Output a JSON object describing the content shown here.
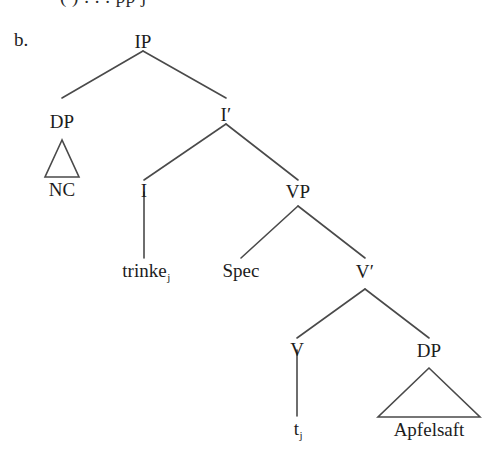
{
  "figure": {
    "item_label": "b.",
    "cropped_top_line": "(  )   . . .  pp   j",
    "language_example": "trinke Apfelsaft",
    "line_color": "#4a4a4a",
    "text_color": "#1c1c1c",
    "background_color": "#ffffff"
  },
  "nodes": {
    "ip": "IP",
    "dp_subject": "DP",
    "nc": "NC",
    "i_bar": "I′",
    "i": "I",
    "trinke": "trinke",
    "trinke_sub": "j",
    "vp": "VP",
    "spec": "Spec",
    "v_bar": "V′",
    "v": "V",
    "trace": "t",
    "trace_sub": "j",
    "dp_object": "DP",
    "apfelsaft": "Apfelsaft"
  },
  "tree": {
    "type": "constituency-tree",
    "root": "IP",
    "edges": [
      [
        "IP",
        "DP"
      ],
      [
        "IP",
        "I′"
      ],
      [
        "DP",
        "NC"
      ],
      [
        "I′",
        "I"
      ],
      [
        "I′",
        "VP"
      ],
      [
        "I",
        "trinke_j"
      ],
      [
        "VP",
        "Spec"
      ],
      [
        "VP",
        "V′"
      ],
      [
        "V′",
        "V"
      ],
      [
        "V′",
        "DP"
      ],
      [
        "V",
        "t_j"
      ],
      [
        "DP",
        "Apfelsaft"
      ]
    ],
    "triangles": [
      "NC",
      "Apfelsaft"
    ]
  }
}
